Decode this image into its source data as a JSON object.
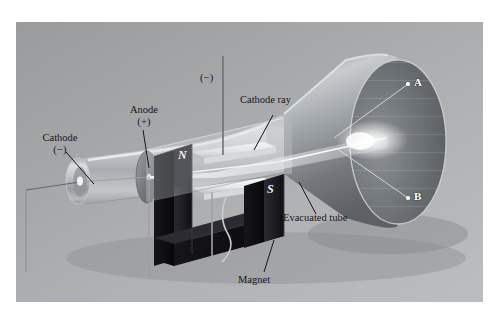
{
  "figure": {
    "plate": {
      "background_top": "#9a9b9d",
      "background_bottom": "#bcbdbe",
      "border_color": "#ffffff"
    }
  },
  "labels": {
    "cathode": {
      "name": "Cathode",
      "sign": "(−)"
    },
    "anode": {
      "name": "Anode",
      "sign": "(+)"
    },
    "cathode_ray": {
      "name": "Cathode ray"
    },
    "evacuated_tube": {
      "name": "Evacuated tube"
    },
    "magnet": {
      "name": "Magnet"
    },
    "terminal_negative": {
      "sign": "(−)"
    },
    "terminal_positive": {
      "sign": "(+)"
    }
  },
  "magnet": {
    "north_pole": "N",
    "south_pole": "S",
    "body_color": "#101014",
    "shape": "horseshoe"
  },
  "screen_points": [
    {
      "id": "A",
      "label": "A",
      "position": "upper"
    },
    {
      "id": "B",
      "label": "B",
      "position": "lower"
    }
  ],
  "colors": {
    "glass": "#c3c6c8",
    "beam": "#ffffff",
    "screen_face": "#6f7276",
    "leader_line": "#1b1b1e"
  }
}
